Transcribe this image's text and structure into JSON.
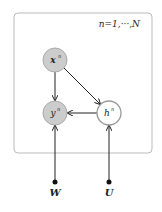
{
  "diagram": {
    "type": "plate-notation-graphical-model",
    "plate": {
      "label": "n=1,···,N",
      "border_color": "#bbbbbb"
    },
    "nodes": [
      {
        "id": "x",
        "label": "x",
        "sup": "n",
        "observed": true,
        "fill": "#cccccc"
      },
      {
        "id": "y",
        "label": "y",
        "sup": "n",
        "observed": true,
        "fill": "#cccccc"
      },
      {
        "id": "h",
        "label": "h",
        "sup": "n",
        "observed": false,
        "fill": "#ffffff"
      }
    ],
    "parameters": [
      {
        "id": "W",
        "label": "W"
      },
      {
        "id": "U",
        "label": "U"
      }
    ],
    "edges": [
      {
        "from": "x",
        "to": "y"
      },
      {
        "from": "x",
        "to": "h"
      },
      {
        "from": "h",
        "to": "y"
      },
      {
        "from": "W",
        "to": "y"
      },
      {
        "from": "U",
        "to": "h"
      }
    ]
  }
}
